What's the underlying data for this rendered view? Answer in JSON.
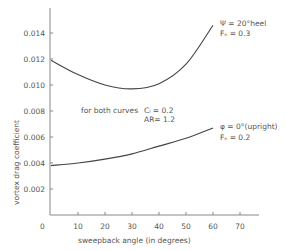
{
  "chart_data": {
    "type": "line",
    "title": "",
    "xlabel": "sweepback angle (in degrees)",
    "ylabel": "vortex drag coefficient",
    "xlim": [
      0,
      75
    ],
    "ylim": [
      0,
      0.016
    ],
    "x_ticks": [
      "0",
      "10",
      "20",
      "30",
      "40",
      "50",
      "60",
      "70"
    ],
    "x_tick_values": [
      0,
      10,
      20,
      30,
      40,
      50,
      60,
      70
    ],
    "y_ticks": [
      "0.014",
      "0.012",
      "0.010",
      "0.008",
      "0.006",
      "0.004",
      "0.002"
    ],
    "y_tick_values": [
      0.014,
      0.012,
      0.01,
      0.008,
      0.006,
      0.004,
      0.002
    ],
    "x_origin_label": "0",
    "grid": false,
    "series": [
      {
        "name": "heel",
        "label_line1": "Ψ  = 20°heel",
        "label_line2": "Fₙ  = 0.3",
        "x": [
          0,
          10,
          20,
          30,
          40,
          50,
          60
        ],
        "y": [
          0.0119,
          0.0108,
          0.01,
          0.0097,
          0.0101,
          0.0116,
          0.0146
        ]
      },
      {
        "name": "upright",
        "label_line1": "φ  = 0°(upright)",
        "label_line2": "Fₙ  = 0.2",
        "x": [
          0,
          10,
          20,
          30,
          40,
          50,
          60
        ],
        "y": [
          0.0038,
          0.004,
          0.0043,
          0.0047,
          0.0053,
          0.0059,
          0.0067
        ]
      }
    ],
    "annotations": {
      "both_curves": "for both curves",
      "cl": "Cₗ = 0.2",
      "ar": "AR= 1.2"
    }
  }
}
